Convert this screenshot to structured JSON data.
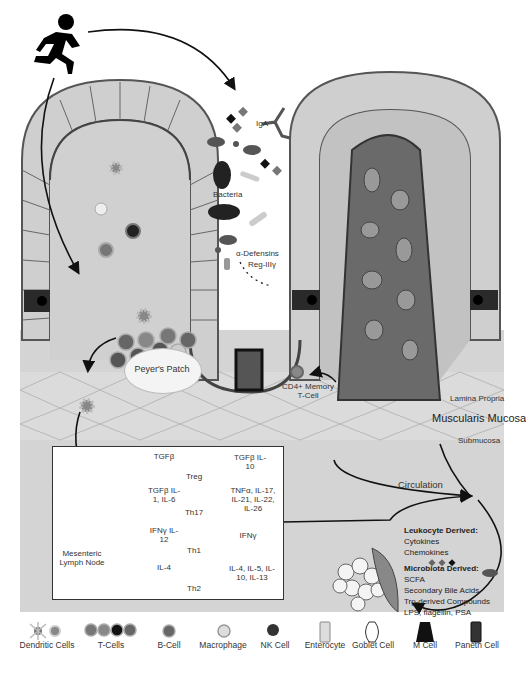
{
  "diagram": {
    "top_labels": {
      "bacteria": "Bacteria",
      "iga": "IgA",
      "alpha_defensins": "α-Defensins",
      "reg3": "Reg-IIIγ"
    },
    "tissue_labels": {
      "peyers_patch": "Peyer's Patch",
      "cd4_memory": "CD4+ Memory T-Cell",
      "lamina_propria": "Lamina Propria",
      "muscularis_mucosa": "Muscularis Mucosa",
      "submucosa": "Submucosa",
      "circulation": "Circulation",
      "mesenteric_lymph_node": "Mesenteric Lymph Node"
    },
    "differentiation": [
      {
        "inputs": "TGFβ",
        "cell": "Treg",
        "outputs": "TGFβ IL-10"
      },
      {
        "inputs": "TGFβ IL-1, IL-6",
        "cell": "Th17",
        "outputs": "TNFα, IL-17, IL-21, IL-22, IL-26"
      },
      {
        "inputs": "IFNγ IL-12",
        "cell": "Th1",
        "outputs": "IFNγ"
      },
      {
        "inputs": "IL-4",
        "cell": "Th2",
        "outputs": "IL-4, IL-5, IL-10, IL-13"
      }
    ],
    "derived": {
      "leukocyte_title": "Leukocyte Derived:",
      "leukocyte_items": [
        "Cytokines",
        "Chemokines"
      ],
      "microbiota_title": "Microbiota Derived:",
      "microbiota_items": [
        "SCFA",
        "Secondary Bile Acids",
        "Trp-derived Compounds",
        "LPS, flagellin, PSA"
      ]
    },
    "legend": [
      {
        "label": "Dendritic Cells",
        "icon": "dendritic-cell-icon"
      },
      {
        "label": "T-Cells",
        "icon": "t-cell-icon"
      },
      {
        "label": "B-Cell",
        "icon": "b-cell-icon"
      },
      {
        "label": "Macrophage",
        "icon": "macrophage-icon"
      },
      {
        "label": "NK Cell",
        "icon": "nk-cell-icon"
      },
      {
        "label": "Enterocyte",
        "icon": "enterocyte-icon"
      },
      {
        "label": "Goblet Cell",
        "icon": "goblet-cell-icon"
      },
      {
        "label": "M Cell",
        "icon": "m-cell-icon"
      },
      {
        "label": "Paneth Cell",
        "icon": "paneth-cell-icon"
      }
    ],
    "colors": {
      "tissue_bg": "#d6d6d6",
      "epithelium": "#c8c8c8",
      "lamina": "#bdbdbd",
      "vessel": "#6a6a6a",
      "dark": "#1a1a1a"
    }
  }
}
